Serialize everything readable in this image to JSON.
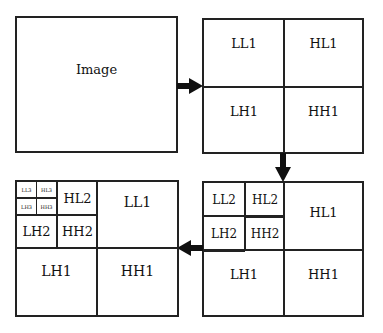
{
  "diagram": {
    "type": "wavelet-decomposition",
    "panels": {
      "original": {
        "label": "Image"
      },
      "level1": {
        "quadrants": {
          "tl": "LL1",
          "tr": "HL1",
          "bl": "LH1",
          "br": "HH1"
        }
      },
      "level2": {
        "sub": {
          "tl": "LL2",
          "tr": "HL2",
          "bl": "LH2",
          "br": "HH2"
        },
        "quadrants": {
          "tr": "HL1",
          "bl": "LH1",
          "br": "HH1"
        }
      },
      "level3": {
        "sub3": {
          "tl": "LL3",
          "tr": "HL3",
          "bl": "LH3",
          "br": "HH3"
        },
        "sub2": {
          "tr": "HL2",
          "bl": "LH2",
          "br": "HH2"
        },
        "quadrants": {
          "tr": "LL1",
          "bl": "LH1",
          "br": "HH1"
        }
      }
    },
    "arrows": [
      {
        "from": "original",
        "to": "level1",
        "direction": "right"
      },
      {
        "from": "level1",
        "to": "level2",
        "direction": "down"
      },
      {
        "from": "level2",
        "to": "level3",
        "direction": "left"
      }
    ],
    "colors": {
      "line": "#222222",
      "background": "#ffffff"
    }
  }
}
